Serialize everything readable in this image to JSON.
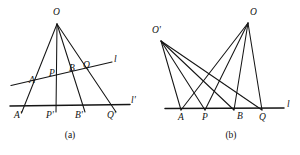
{
  "figure": {
    "caption_a": "(a)",
    "caption_b": "(b)"
  },
  "panel_a": {
    "name": "perspective-from-point-O",
    "vertex_label": "O",
    "line_l_label": "l",
    "line_l_prime_label": "l'",
    "upper_points": [
      "A",
      "P",
      "B",
      "Q"
    ],
    "lower_points": [
      "A'",
      "P'",
      "B'",
      "Q'"
    ],
    "labels": {
      "O": "O",
      "A": "A",
      "P": "P",
      "B": "B",
      "Q": "Q",
      "A_prime": "A'",
      "P_prime": "P'",
      "B_prime": "B'",
      "Q_prime": "Q'",
      "l": "l",
      "l_prime": "l'"
    }
  },
  "panel_b": {
    "name": "two-centers-same-line",
    "vertex_labels": [
      "O",
      "O'"
    ],
    "line_label": "l",
    "points": [
      "A",
      "P",
      "B",
      "Q"
    ],
    "labels": {
      "O": "O",
      "O_prime": "O'",
      "A": "A",
      "P": "P",
      "B": "B",
      "Q": "Q",
      "l": "l"
    }
  },
  "colors": {
    "ink": "#151515",
    "background": "#ffffff"
  }
}
